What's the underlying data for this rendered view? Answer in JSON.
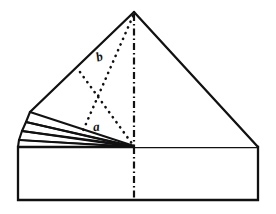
{
  "figure": {
    "background_color": "#ffffff",
    "ink_color": "#111111",
    "canvas": {
      "width": 276,
      "height": 214
    }
  },
  "labels": {
    "upper_angle": "b",
    "lower_angle": "a"
  },
  "geometry": {
    "apex": {
      "x": 134,
      "y": 12
    },
    "triangle_left_vertex": {
      "x": 30,
      "y": 112
    },
    "triangle_right_vertex": {
      "x": 258,
      "y": 147
    },
    "centre_bottom": {
      "x": 134,
      "y": 147
    },
    "rectangle": {
      "left": 18,
      "top": 147,
      "right": 258,
      "bottom": 200
    }
  },
  "line_styles": {
    "edge": "solid",
    "crease": "dotted",
    "centre_axis": "dash-dot"
  },
  "elements": {
    "triangle_name": "main-triangle-flap",
    "rectangle_name": "base-rectangle",
    "flaps_name": "layered-left-flaps",
    "crease_x_name": "dotted-crease-lines",
    "axis_name": "centre-dash-dot-axis"
  }
}
